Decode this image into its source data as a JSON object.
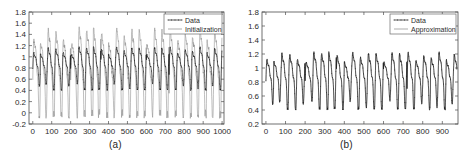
{
  "figure": {
    "background": "#ffffff",
    "foreground": "#1a1a1a",
    "panels": [
      {
        "id": "a",
        "caption": "(a)",
        "legend": {
          "position": "top-right",
          "entries": [
            {
              "label": "Data",
              "style": "line-with-markers",
              "color": "#111111"
            },
            {
              "label": "Initialization",
              "style": "line",
              "color": "#8a8a8a"
            }
          ]
        },
        "chart_data": {
          "type": "line",
          "title": "",
          "xlabel": "",
          "ylabel": "",
          "xlim": [
            -20,
            1010
          ],
          "ylim": [
            -0.2,
            1.8
          ],
          "grid": false,
          "xticks": [
            0,
            100,
            200,
            300,
            400,
            500,
            600,
            700,
            800,
            900,
            1000
          ],
          "xticklabels": [
            "0",
            "100",
            "200",
            "300",
            "400",
            "500",
            "600",
            "700",
            "800",
            "900",
            "1000"
          ],
          "yticks": [
            -0.2,
            0,
            0.2,
            0.4,
            0.6,
            0.8,
            1,
            1.2,
            1.4,
            1.6,
            1.8
          ],
          "yticklabels": [
            "-0.2",
            "0",
            "0.2",
            "0.4",
            "0.6",
            "0.8",
            "1",
            "1.2",
            "1.4",
            "1.6",
            "1.8"
          ],
          "series": [
            {
              "name": "Data",
              "style": "line-with-markers",
              "color": "#111111",
              "n_points": 1000,
              "description": "Quasi-periodic oscillation, period about 40 samples, range approximately 0.40 to 1.28, mean near 0.9",
              "period": 40,
              "ymin": 0.4,
              "ymax": 1.28,
              "mean": 0.9
            },
            {
              "name": "Initialization",
              "style": "line",
              "color": "#8a8a8a",
              "n_points": 1000,
              "description": "Same periodicity but larger amplitude with sharp spikes up to about 1.55 and dips down to about -0.1",
              "period": 40,
              "ymin": -0.1,
              "ymax": 1.55,
              "mean": 0.85
            }
          ]
        }
      },
      {
        "id": "b",
        "caption": "(b)",
        "legend": {
          "position": "top-right",
          "entries": [
            {
              "label": "Data",
              "style": "line-with-markers",
              "color": "#111111"
            },
            {
              "label": "Approximation",
              "style": "line",
              "color": "#8a8a8a"
            }
          ]
        },
        "chart_data": {
          "type": "line",
          "title": "",
          "xlabel": "",
          "ylabel": "",
          "xlim": [
            -20,
            980
          ],
          "ylim": [
            0.2,
            1.8
          ],
          "grid": false,
          "xticks": [
            0,
            100,
            200,
            300,
            400,
            500,
            600,
            700,
            800,
            900
          ],
          "xticklabels": [
            "0",
            "100",
            "200",
            "300",
            "400",
            "500",
            "600",
            "700",
            "800",
            "900"
          ],
          "yticks": [
            0.2,
            0.4,
            0.6,
            0.8,
            1,
            1.2,
            1.4,
            1.6,
            1.8
          ],
          "yticklabels": [
            "0.2",
            "0.4",
            "0.6",
            "0.8",
            "1",
            "1.2",
            "1.4",
            "1.6",
            "1.8"
          ],
          "series": [
            {
              "name": "Data",
              "style": "line-with-markers",
              "color": "#111111",
              "n_points": 975,
              "description": "Quasi-periodic oscillation, period about 40 samples, range approximately 0.40 to 1.34, mean near 0.9",
              "period": 40,
              "ymin": 0.4,
              "ymax": 1.34,
              "mean": 0.9
            },
            {
              "name": "Approximation",
              "style": "line",
              "color": "#8a8a8a",
              "n_points": 975,
              "description": "Closely overlaps the data curve, nearly indistinguishable at this scale",
              "period": 40,
              "ymin": 0.42,
              "ymax": 1.32,
              "mean": 0.9
            }
          ]
        }
      }
    ]
  }
}
